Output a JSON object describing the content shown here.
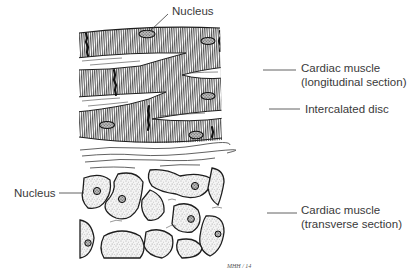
{
  "figure": {
    "colors": {
      "ink": "#1e1e1e",
      "stipple": "#555555",
      "paper": "#ffffff",
      "label_text": "#3a3a3a",
      "leader": "#3a3a3a"
    },
    "signature": "MHH / 14"
  },
  "labels": [
    {
      "id": "nucleus-top",
      "lines": [
        "Nucleus"
      ]
    },
    {
      "id": "cardiac-longitudinal",
      "lines": [
        "Cardiac muscle",
        "(longitudinal section)"
      ]
    },
    {
      "id": "intercalated-disc",
      "lines": [
        "Intercalated disc"
      ]
    },
    {
      "id": "nucleus-left",
      "lines": [
        "Nucleus"
      ]
    },
    {
      "id": "cardiac-transverse",
      "lines": [
        "Cardiac muscle",
        "(transverse section)"
      ]
    }
  ]
}
